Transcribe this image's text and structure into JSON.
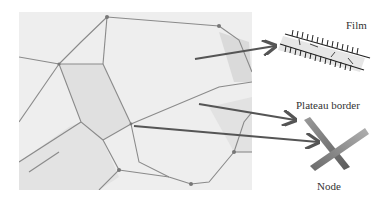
{
  "diagram": {
    "labels": {
      "film": "Film",
      "plateau_border": "Plateau border",
      "node": "Node"
    },
    "colors": {
      "arrow": "#555555",
      "photo_bg": "#efefef",
      "bubble_edge": "#8a8a8a",
      "label_text": "#333333"
    }
  }
}
